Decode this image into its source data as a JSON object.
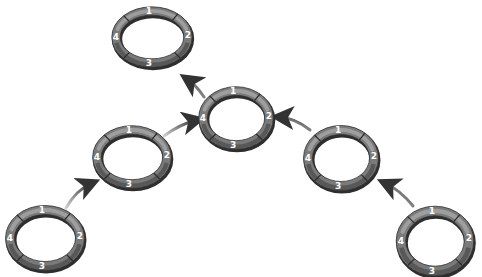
{
  "diagram": {
    "segment_labels": [
      "1",
      "2",
      "3",
      "4"
    ],
    "colors": {
      "ring_dark": "#4a4a4a",
      "ring_mid": "#7a7a7a",
      "ring_light": "#a8a8a8",
      "arrow": "#3c3c3c",
      "label": "#ffffff",
      "background": "#ffffff"
    },
    "rings": [
      {
        "id": "top-left",
        "cx": 152,
        "cy": 37,
        "rx": 36,
        "ry": 26,
        "labels": [
          "1",
          "2",
          "3",
          "4"
        ]
      },
      {
        "id": "center",
        "cx": 236,
        "cy": 118,
        "rx": 33,
        "ry": 27,
        "labels": [
          "1",
          "2",
          "3",
          "4"
        ]
      },
      {
        "id": "mid-left",
        "cx": 132,
        "cy": 157,
        "rx": 35,
        "ry": 27,
        "labels": [
          "1",
          "2",
          "3",
          "4"
        ]
      },
      {
        "id": "mid-right",
        "cx": 341,
        "cy": 158,
        "rx": 33,
        "ry": 28,
        "labels": [
          "1",
          "2",
          "3",
          "4"
        ]
      },
      {
        "id": "bottom-left",
        "cx": 45,
        "cy": 238,
        "rx": 35,
        "ry": 28,
        "labels": [
          "1",
          "2",
          "3",
          "4"
        ]
      },
      {
        "id": "bottom-right",
        "cx": 435,
        "cy": 241,
        "rx": 34,
        "ry": 30,
        "labels": [
          "1",
          "2",
          "3",
          "4"
        ]
      }
    ],
    "arrows": [
      {
        "id": "center-to-top-left",
        "from": "center",
        "to": "top-left"
      },
      {
        "id": "mid-left-to-center",
        "from": "mid-left",
        "to": "center"
      },
      {
        "id": "mid-right-to-center",
        "from": "mid-right",
        "to": "center"
      },
      {
        "id": "bottom-left-to-mid-left",
        "from": "bottom-left",
        "to": "mid-left"
      },
      {
        "id": "bottom-right-to-mid-right",
        "from": "bottom-right",
        "to": "mid-right"
      }
    ]
  }
}
